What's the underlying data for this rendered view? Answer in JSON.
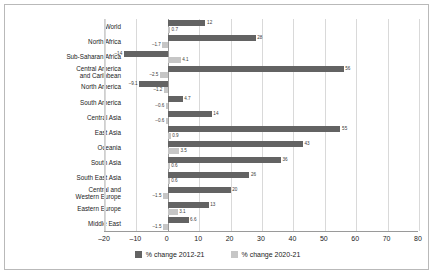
{
  "chart_data": {
    "type": "bar",
    "orientation": "horizontal",
    "title": "",
    "xlabel": "",
    "ylabel": "",
    "xlim": [
      -20,
      80
    ],
    "xticks": [
      -20,
      -10,
      0,
      10,
      20,
      30,
      40,
      50,
      60,
      70,
      80
    ],
    "grid": true,
    "legend_position": "bottom",
    "categories": [
      "World",
      "North Africa",
      "Sub-Saharan Africa",
      "Central America\nand Caribbean",
      "North America",
      "South America",
      "Central Asia",
      "East Asia",
      "Oceania",
      "South Asia",
      "South East Asia",
      "Central and\nWestern Europe",
      "Eastern Europe",
      "Middle East"
    ],
    "series": [
      {
        "name": "% change 2012-21",
        "color": "#636363",
        "values": [
          12,
          28,
          -14,
          56,
          -9.1,
          4.7,
          14,
          55,
          43,
          36,
          26,
          20,
          13,
          6.6
        ],
        "labels": [
          "12",
          "28",
          "-14",
          "56",
          "-9.1",
          "4.7",
          "14",
          "55",
          "43",
          "36",
          "26",
          "20",
          "13",
          "6.6"
        ]
      },
      {
        "name": "% change 2020-21",
        "color": "#c6c6c6",
        "values": [
          0.7,
          -1.7,
          4.1,
          -2.5,
          -1.2,
          -0.6,
          -0.6,
          0.9,
          3.5,
          0.6,
          0.6,
          -1.5,
          3.1,
          -1.5
        ],
        "labels": [
          "0.7",
          "-1.7",
          "4.1",
          "-2.5",
          "-1.2",
          "-0.6",
          "-0.6",
          "0.9",
          "3.5",
          "0.6",
          "0.6",
          "-1.5",
          "3.1",
          "-1.5"
        ]
      }
    ]
  },
  "legend": {
    "items": [
      {
        "label": "% change 2012-21"
      },
      {
        "label": "% change 2020-21"
      }
    ]
  }
}
